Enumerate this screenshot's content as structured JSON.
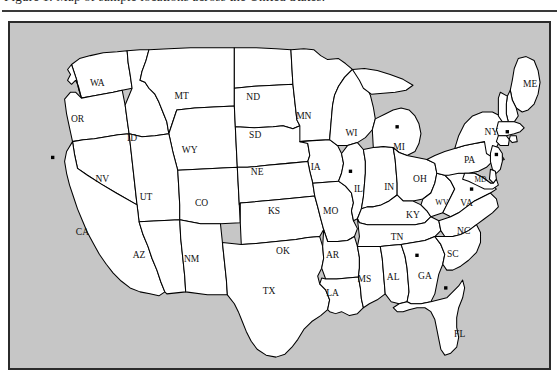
{
  "page": {
    "caption_text": "Figure 1. Map of sample locations across the United States.",
    "background_color": "#ffffff"
  },
  "figure": {
    "frame_background": "#c6c6c6",
    "frame_border_color": "#2b2b2b",
    "land_fill": "#ffffff",
    "border_stroke": "#000000",
    "marker_color": "#000000",
    "marker_count": 8
  },
  "map": {
    "title": "United States state map with location markers",
    "states": [
      {
        "code": "WA",
        "x": 88,
        "y": 62
      },
      {
        "code": "OR",
        "x": 68,
        "y": 98
      },
      {
        "code": "ID",
        "x": 123,
        "y": 117
      },
      {
        "code": "MT",
        "x": 173,
        "y": 75
      },
      {
        "code": "WY",
        "x": 181,
        "y": 129
      },
      {
        "code": "ND",
        "x": 245,
        "y": 76
      },
      {
        "code": "SD",
        "x": 247,
        "y": 114
      },
      {
        "code": "NE",
        "x": 249,
        "y": 152
      },
      {
        "code": "MN",
        "x": 296,
        "y": 95
      },
      {
        "code": "IA",
        "x": 308,
        "y": 146
      },
      {
        "code": "WI",
        "x": 344,
        "y": 112
      },
      {
        "code": "NV",
        "x": 93,
        "y": 159
      },
      {
        "code": "UT",
        "x": 137,
        "y": 177
      },
      {
        "code": "CA",
        "x": 73,
        "y": 212
      },
      {
        "code": "CO",
        "x": 193,
        "y": 183
      },
      {
        "code": "AZ",
        "x": 130,
        "y": 236
      },
      {
        "code": "NM",
        "x": 183,
        "y": 240
      },
      {
        "code": "KS",
        "x": 266,
        "y": 191
      },
      {
        "code": "OK",
        "x": 275,
        "y": 231
      },
      {
        "code": "TX",
        "x": 261,
        "y": 272
      },
      {
        "code": "MO",
        "x": 323,
        "y": 191
      },
      {
        "code": "AR",
        "x": 325,
        "y": 236
      },
      {
        "code": "LA",
        "x": 325,
        "y": 274
      },
      {
        "code": "IL",
        "x": 351,
        "y": 169
      },
      {
        "code": "MS",
        "x": 357,
        "y": 260
      },
      {
        "code": "IN",
        "x": 382,
        "y": 167
      },
      {
        "code": "MI",
        "x": 392,
        "y": 126
      },
      {
        "code": "OH",
        "x": 413,
        "y": 159
      },
      {
        "code": "KY",
        "x": 406,
        "y": 195
      },
      {
        "code": "TN",
        "x": 390,
        "y": 217
      },
      {
        "code": "AL",
        "x": 386,
        "y": 258
      },
      {
        "code": "GA",
        "x": 418,
        "y": 257
      },
      {
        "code": "WV",
        "x": 435,
        "y": 182
      },
      {
        "code": "VA",
        "x": 460,
        "y": 183
      },
      {
        "code": "NC",
        "x": 457,
        "y": 211
      },
      {
        "code": "SC",
        "x": 446,
        "y": 234
      },
      {
        "code": "FL",
        "x": 453,
        "y": 315
      },
      {
        "code": "PA",
        "x": 463,
        "y": 139
      },
      {
        "code": "NY",
        "x": 485,
        "y": 111
      },
      {
        "code": "ME",
        "x": 524,
        "y": 63
      },
      {
        "code": "MD",
        "x": 474,
        "y": 159
      }
    ],
    "markers": [
      {
        "label": "marker-california",
        "x": 43,
        "y": 136
      },
      {
        "label": "marker-illinois",
        "x": 343,
        "y": 150
      },
      {
        "label": "marker-michigan",
        "x": 390,
        "y": 105
      },
      {
        "label": "marker-massachusetts",
        "x": 501,
        "y": 110
      },
      {
        "label": "marker-newjersey",
        "x": 490,
        "y": 133
      },
      {
        "label": "marker-virginia",
        "x": 465,
        "y": 168
      },
      {
        "label": "marker-georgia",
        "x": 410,
        "y": 235
      },
      {
        "label": "marker-florida",
        "x": 439,
        "y": 268
      }
    ]
  }
}
